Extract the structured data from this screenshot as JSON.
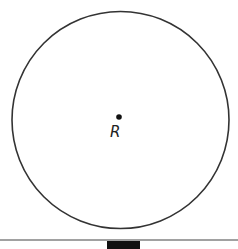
{
  "diagram": {
    "circle": {
      "cx": 120.5,
      "cy": 120,
      "r": 108.5,
      "stroke": "#333333"
    },
    "center_point": {
      "label": "R",
      "x": 119,
      "y": 117
    },
    "ground_line": {
      "y": 240,
      "stroke": "#444444"
    },
    "base_block": {
      "x": 107,
      "y": 241,
      "width": 33,
      "height": 8,
      "fill": "#111111"
    }
  }
}
